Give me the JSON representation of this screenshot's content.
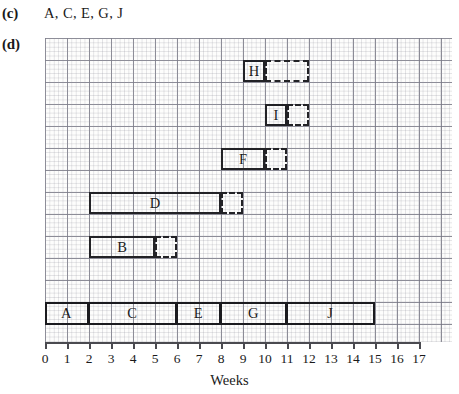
{
  "part_c": {
    "label": "(c)",
    "answer": "A, C, E, G, J"
  },
  "part_d": {
    "label": "(d)"
  },
  "chart_data": {
    "type": "bar",
    "title": "",
    "xlabel": "Weeks",
    "ylabel": "",
    "xlim": [
      0,
      17
    ],
    "grid": true,
    "legend": "none",
    "xticks": [
      "0",
      "1",
      "2",
      "3",
      "4",
      "5",
      "6",
      "7",
      "8",
      "9",
      "10",
      "11",
      "12",
      "13",
      "14",
      "15",
      "16",
      "17"
    ],
    "week_pixel_width": 22,
    "activities": [
      {
        "name": "H",
        "row": 1,
        "start": 9,
        "duration": 1,
        "float": 2,
        "end": 10,
        "float_end": 12
      },
      {
        "name": "I",
        "row": 3,
        "start": 10,
        "duration": 1,
        "float": 1,
        "end": 11,
        "float_end": 12
      },
      {
        "name": "F",
        "row": 5,
        "start": 8,
        "duration": 2,
        "float": 1,
        "end": 10,
        "float_end": 11
      },
      {
        "name": "D",
        "row": 7,
        "start": 2,
        "duration": 6,
        "float": 1,
        "end": 8,
        "float_end": 9
      },
      {
        "name": "B",
        "row": 9,
        "start": 2,
        "duration": 3,
        "float": 1,
        "end": 5,
        "float_end": 6
      }
    ],
    "critical_path": {
      "row": 12,
      "label": "critical path",
      "segments": [
        {
          "name": "A",
          "start": 0,
          "end": 2
        },
        {
          "name": "C",
          "start": 2,
          "end": 6
        },
        {
          "name": "E",
          "start": 6,
          "end": 8
        },
        {
          "name": "G",
          "start": 8,
          "end": 11
        },
        {
          "name": "J",
          "start": 11,
          "end": 15
        }
      ]
    }
  },
  "colors": {
    "bar_outline": "#222226",
    "grid_major": "#6e6e7d",
    "grid_minor": "#96969f",
    "axis": "#4a4a50",
    "text": "#1a1a1a"
  }
}
